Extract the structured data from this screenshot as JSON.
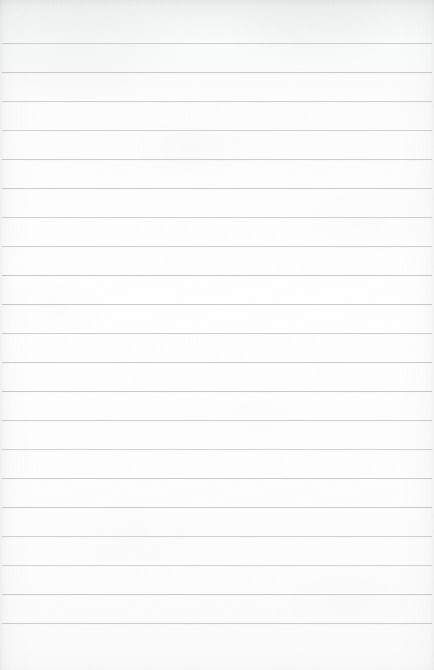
{
  "document": {
    "kind": "scanned-ruled-paper",
    "title": "Blank ruled notebook page",
    "content_text": "",
    "page_width": 434,
    "page_height": 670
  },
  "paper": {
    "background_color": "#fdfdfd",
    "base_tone_top": "#f2f3f4",
    "base_tone_mid": "#ffffff",
    "base_tone_bottom": "#fbfbfb",
    "texture": "fibrous scan grain with soft mottling",
    "edge_shadow": "top and left edges darkest, right edge faint"
  },
  "rules": {
    "line_color": "#c6c7cb",
    "line_thickness_px": 1,
    "line_count": 21,
    "first_line_y": 43,
    "line_spacing_px": 29,
    "inset_left_px": 2,
    "inset_right_px": 2,
    "header_band_height_px": 43,
    "positions_y": [
      43,
      72,
      101,
      130,
      159,
      188,
      217,
      246,
      275,
      304,
      333,
      362,
      391,
      420,
      449,
      478,
      507,
      536,
      565,
      594,
      623
    ]
  }
}
